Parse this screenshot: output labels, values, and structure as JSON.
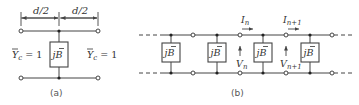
{
  "figure_a": {
    "caption": "(a)",
    "dim_left": "d/2",
    "dim_right": "d/2",
    "left_label": "Ȳc = 1",
    "left_label_parts": {
      "sym": "Y",
      "sub": "c",
      "rest": " = 1"
    },
    "right_label_parts": {
      "sym": "Y",
      "sub": "c",
      "rest": " = 1"
    },
    "element_label": "jB̄",
    "element_parts": {
      "j": "j",
      "B": "B"
    }
  },
  "figure_b": {
    "caption": "(b)",
    "element_parts": {
      "j": "j",
      "B": "B"
    },
    "element_count": 4,
    "currents": [
      {
        "sym": "I",
        "sub": "n"
      },
      {
        "sym": "I",
        "sub": "n+1"
      }
    ],
    "voltages": [
      {
        "sym": "V",
        "sub": "n"
      },
      {
        "sym": "V",
        "sub": "n+1"
      }
    ]
  },
  "colors": {
    "line": "#444444",
    "text": "#333333",
    "background": "#ffffff"
  }
}
